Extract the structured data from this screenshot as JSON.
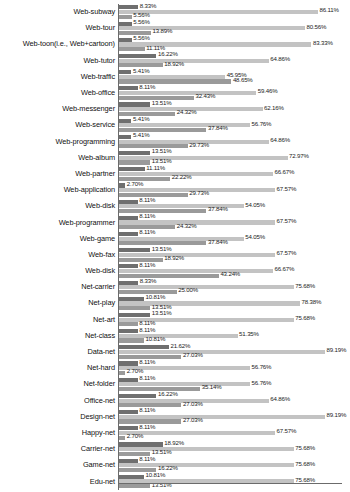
{
  "chart_data": {
    "type": "bar",
    "orientation": "horizontal",
    "title": "",
    "xlabel": "",
    "ylabel": "",
    "xlim": [
      0,
      100
    ],
    "grid": false,
    "legend": null,
    "unit": "%",
    "categories": [
      "Web-subway",
      "Web-tour",
      "Web-toon(i.e., Web+cartoon)",
      "Web-tutor",
      "Web-traffic",
      "Web-office",
      "Web-messenger",
      "Web-service",
      "Web-programming",
      "Web-album",
      "Web-partner",
      "Web-application",
      "Web-disk",
      "Web-programmer",
      "Web-game",
      "Web-fax",
      "Web-disk",
      "Net-carrier",
      "Net-play",
      "Net-art",
      "Net-class",
      "Data-net",
      "Net-hard",
      "Net-folder",
      "Office-net",
      "Design-net",
      "Happy-net",
      "Carrier-net",
      "Game-net",
      "Edu-net"
    ],
    "series": [
      {
        "name": "series-1",
        "values": [
          8.33,
          5.56,
          5.56,
          16.22,
          5.41,
          8.11,
          13.51,
          5.41,
          5.41,
          13.51,
          11.11,
          2.7,
          8.11,
          8.11,
          8.11,
          13.51,
          8.11,
          8.33,
          10.81,
          13.51,
          8.11,
          21.62,
          8.11,
          8.11,
          16.22,
          8.11,
          8.11,
          18.92,
          8.11,
          10.81
        ]
      },
      {
        "name": "series-2",
        "values": [
          86.11,
          80.56,
          83.33,
          64.86,
          45.95,
          59.46,
          62.16,
          56.76,
          64.86,
          72.97,
          66.67,
          67.57,
          54.05,
          67.57,
          54.05,
          67.57,
          66.67,
          75.68,
          78.38,
          75.68,
          51.35,
          89.19,
          56.76,
          56.76,
          64.86,
          89.19,
          67.57,
          75.68,
          75.68,
          75.68
        ]
      },
      {
        "name": "series-3",
        "values": [
          5.56,
          13.89,
          11.11,
          18.92,
          48.65,
          32.43,
          24.32,
          37.84,
          29.73,
          13.51,
          22.22,
          29.73,
          37.84,
          24.32,
          37.84,
          18.92,
          43.24,
          25.0,
          13.51,
          8.11,
          10.81,
          27.03,
          2.7,
          35.14,
          27.03,
          27.03,
          2.7,
          13.51,
          16.22,
          13.51
        ]
      }
    ],
    "labels": {
      "series1": [
        "8.33%",
        "5.56%",
        "5.56%",
        "16.22%",
        "5.41%",
        "8.11%",
        "13.51%",
        "5.41%",
        "5.41%",
        "13.51%",
        "11.11%",
        "2.70%",
        "8.11%",
        "8.11%",
        "8.11%",
        "13.51%",
        "8.11%",
        "8.33%",
        "10.81%",
        "13.51%",
        "8.11%",
        "21.62%",
        "8.11%",
        "8.11%",
        "16.22%",
        "8.11%",
        "8.11%",
        "18.92%",
        "8.11%",
        "10.81%"
      ],
      "series2": [
        "86.11%",
        "80.56%",
        "83.33%",
        "64.86%",
        "45.95%",
        "59.46%",
        "62.16%",
        "56.76%",
        "64.86%",
        "72.97%",
        "66.67%",
        "67.57%",
        "54.05%",
        "67.57%",
        "54.05%",
        "67.57%",
        "66.67%",
        "75.68%",
        "78.38%",
        "75.68%",
        "51.35%",
        "89.19%",
        "56.76%",
        "56.76%",
        "64.86%",
        "89.19%",
        "67.57%",
        "75.68%",
        "75.68%",
        "75.68%"
      ],
      "series3": [
        "5.56%",
        "13.89%",
        "11.11%",
        "18.92%",
        "48.65%",
        "32.43%",
        "24.32%",
        "37.84%",
        "29.73%",
        "13.51%",
        "22.22%",
        "29.73%",
        "37.84%",
        "24.32%",
        "37.84%",
        "18.92%",
        "43.24%",
        "25.00%",
        "13.51%",
        "8.11%",
        "10.81%",
        "27.03%",
        "2.70%",
        "35.14%",
        "27.03%",
        "27.03%",
        "2.70%",
        "13.51%",
        "16.22%",
        "13.51%"
      ]
    },
    "colors": {
      "series1": "#6f6f6f",
      "series2": "#c3c3c3",
      "series3": "#9a9a9a",
      "axis": "#6b6b6b",
      "text": "#1a1a1a",
      "background": "#ffffff"
    }
  }
}
